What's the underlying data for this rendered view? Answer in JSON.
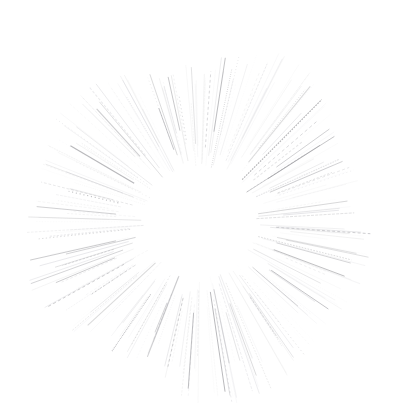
{
  "figure": {
    "type": "radial-line-burst",
    "canvas": {
      "width": 400,
      "height": 403,
      "background_color": "#ffffff"
    }
  },
  "chart_data": {
    "type": "scatter",
    "subtitle": "",
    "xlabel": "",
    "ylabel": "",
    "grid": false,
    "legend": null,
    "axes_visible": false,
    "tick_labels": [],
    "annotations": [],
    "xlim": [
      0,
      400
    ],
    "ylim": [
      0,
      403
    ],
    "center": {
      "x": 200,
      "y": 222
    },
    "inner_radius": 64,
    "outer_radius_mean": 172,
    "outer_radius_min": 96,
    "outer_radius_max": 186,
    "ray_count": 260,
    "stroke_color_base": "#8a8a8f",
    "stroke_color_dark": "#6e6e74",
    "stroke_color_light": "#d8d8dc",
    "stroke_width_min": 0.4,
    "stroke_width_max": 1.1,
    "opacity_min": 0.06,
    "opacity_max": 0.62,
    "dash_fraction": 0.34
  },
  "render": {
    "seed": 20240517,
    "angle_jitter_deg": 1.25,
    "length_jitter": 0.26
  }
}
